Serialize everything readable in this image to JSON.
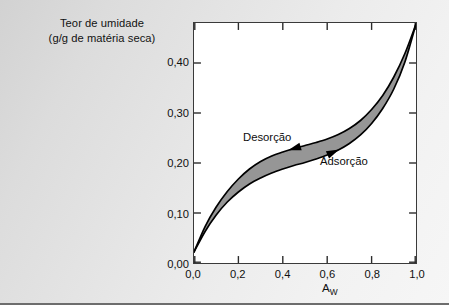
{
  "figure": {
    "background_color": "#e6e6e6",
    "plot_background_color": "#ffffff",
    "frame_color": "#3a3a3a",
    "band_fill_color": "#969696",
    "curve_color": "#000000"
  },
  "chart_data": {
    "type": "area",
    "title": "",
    "subtitle": "",
    "xlabel": "A",
    "xlabel_subscript": "W",
    "ylabel": "Teor de umidade",
    "ylabel_line2": "(g/g de matéria seca)",
    "xlim": [
      0.0,
      1.0
    ],
    "ylim": [
      0.0,
      0.48
    ],
    "grid": false,
    "legend_position": "inline-annotations",
    "xticks": [
      0.0,
      0.2,
      0.4,
      0.6,
      0.8,
      1.0
    ],
    "xtick_labels": [
      "0,0",
      "0,2",
      "0,4",
      "0,6",
      "0,8",
      "1,0"
    ],
    "yticks": [
      0.0,
      0.1,
      0.2,
      0.3,
      0.4
    ],
    "ytick_labels": [
      "0,00",
      "0,10",
      "0,20",
      "0,30",
      "0,40"
    ],
    "x": [
      0.0,
      0.05,
      0.1,
      0.15,
      0.2,
      0.25,
      0.3,
      0.35,
      0.4,
      0.45,
      0.5,
      0.55,
      0.6,
      0.65,
      0.7,
      0.75,
      0.8,
      0.85,
      0.9,
      0.95,
      1.0
    ],
    "series": [
      {
        "name": "Desorção",
        "label": "Desorção",
        "arrow_direction": "left",
        "values": [
          0.022,
          0.073,
          0.112,
          0.143,
          0.168,
          0.188,
          0.203,
          0.214,
          0.222,
          0.229,
          0.235,
          0.241,
          0.248,
          0.257,
          0.269,
          0.285,
          0.307,
          0.335,
          0.372,
          0.419,
          0.478
        ]
      },
      {
        "name": "Adsorção",
        "label": "Adsorção",
        "arrow_direction": "right",
        "values": [
          0.022,
          0.063,
          0.096,
          0.122,
          0.142,
          0.158,
          0.17,
          0.18,
          0.188,
          0.195,
          0.201,
          0.208,
          0.216,
          0.226,
          0.239,
          0.256,
          0.279,
          0.309,
          0.348,
          0.402,
          0.478
        ]
      }
    ],
    "annotations": [
      {
        "text": "Desorção",
        "x": 0.39,
        "y": 0.265,
        "series": "Desorção"
      },
      {
        "text": "Adsorção",
        "x": 0.7,
        "y": 0.205,
        "series": "Adsorção"
      }
    ]
  }
}
